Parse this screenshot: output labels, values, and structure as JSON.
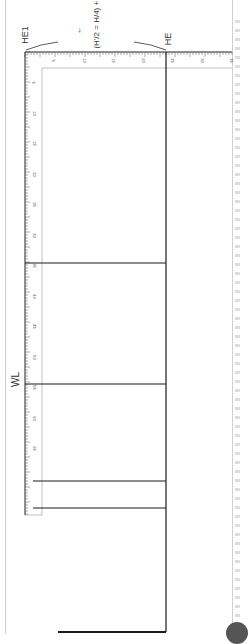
{
  "diagram": {
    "type": "pattern drafting diagram (rotated 90°)",
    "labels": {
      "he1": "HE1",
      "he": "HE",
      "wl": "WL",
      "formula": "(H'/2 = H/4) +1",
      "arrow": "←"
    },
    "ruler_horizontal": {
      "tick_labels": [
        "5",
        "10",
        "15",
        "20",
        "25",
        "30",
        "35"
      ]
    },
    "ruler_vertical": {
      "tick_labels": [
        "5",
        "10",
        "15",
        "20",
        "25",
        "30",
        "35",
        "40",
        "45",
        "50",
        "55",
        "60",
        "65"
      ]
    },
    "lines": {
      "horizontal_guides_y": [
        263,
        384,
        481,
        508
      ],
      "bottom_line_y": 632
    },
    "colors": {
      "line": "#1a1a1a",
      "ruler": "#555555",
      "frame": "#cfcfcf"
    }
  }
}
